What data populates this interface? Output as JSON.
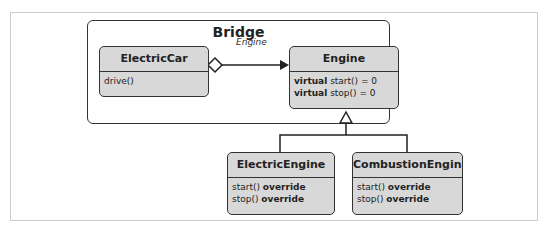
{
  "diagram": {
    "container_title": "Bridge",
    "association_label": "Engine",
    "classes": [
      {
        "name": "ElectricCar",
        "members": [
          {
            "prefix": "",
            "text": "drive()",
            "suffix": ""
          }
        ]
      },
      {
        "name": "Engine",
        "members": [
          {
            "prefix": "virtual",
            "text": " start() = 0",
            "suffix": ""
          },
          {
            "prefix": "virtual",
            "text": " stop() = 0",
            "suffix": ""
          }
        ]
      },
      {
        "name": "ElectricEngine",
        "members": [
          {
            "prefix": "",
            "text": "start() ",
            "suffix": "override"
          },
          {
            "prefix": "",
            "text": "stop() ",
            "suffix": "override"
          }
        ]
      },
      {
        "name": "CombustionEngine",
        "members": [
          {
            "prefix": "",
            "text": "start() ",
            "suffix": "override"
          },
          {
            "prefix": "",
            "text": "stop() ",
            "suffix": "override"
          }
        ]
      }
    ],
    "relations": [
      {
        "type": "aggregation",
        "from": "ElectricCar",
        "to": "Engine",
        "label": "Engine"
      },
      {
        "type": "inheritance",
        "from": "ElectricEngine",
        "to": "Engine"
      },
      {
        "type": "inheritance",
        "from": "CombustionEngine",
        "to": "Engine"
      }
    ]
  }
}
